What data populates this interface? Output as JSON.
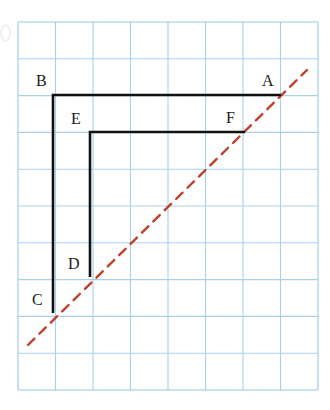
{
  "figure": {
    "canvas": {
      "width": 330,
      "height": 410,
      "background": "#ffffff"
    },
    "grid": {
      "name": "graph-paper-grid",
      "origin_x": 18,
      "origin_y": 22,
      "cols": 8,
      "rows": 10,
      "cell_width": 37.5,
      "cell_height": 36.8,
      "line_color": "#a9cfea",
      "line_width": 1.1,
      "border_color": "#9ac7e6",
      "visible": true
    },
    "shapes": {
      "polyline_outer": {
        "name": "polyline-ABC",
        "label": "B-A and B-C",
        "color": "#111111",
        "width": 2.6,
        "points": [
          [
            281,
            95
          ],
          [
            53,
            95
          ],
          [
            53,
            313
          ]
        ]
      },
      "polyline_inner": {
        "name": "polyline-FED",
        "label": "F-E and E-D",
        "color": "#111111",
        "width": 2.6,
        "points": [
          [
            245,
            132
          ],
          [
            90,
            132
          ],
          [
            90,
            277
          ]
        ]
      },
      "mirror_line": {
        "name": "dashed-mirror-line",
        "color": "#c0402b",
        "width": 2.4,
        "dash": "9 7",
        "from": [
          28,
          345
        ],
        "to": [
          307,
          70
        ]
      }
    },
    "labels": [
      {
        "id": "A",
        "text": "A",
        "x": 262,
        "y": 73,
        "anchor": "point-A"
      },
      {
        "id": "B",
        "text": "B",
        "x": 36,
        "y": 73,
        "anchor": "point-B"
      },
      {
        "id": "C",
        "text": "C",
        "x": 32,
        "y": 292,
        "anchor": "point-C"
      },
      {
        "id": "D",
        "text": "D",
        "x": 68,
        "y": 256,
        "anchor": "point-D"
      },
      {
        "id": "E",
        "text": "E",
        "x": 71,
        "y": 111,
        "anchor": "point-E"
      },
      {
        "id": "F",
        "text": "F",
        "x": 226,
        "y": 110,
        "anchor": "point-F"
      }
    ],
    "artifact": {
      "name": "scan-edge-artifact",
      "x": 1,
      "y": 25,
      "width": 9,
      "height": 16,
      "color": "#d9dde0"
    },
    "colors": {
      "grid_blue": "#a9cfea",
      "stroke_black": "#111111",
      "dash_red": "#c0402b",
      "background": "#ffffff"
    }
  }
}
